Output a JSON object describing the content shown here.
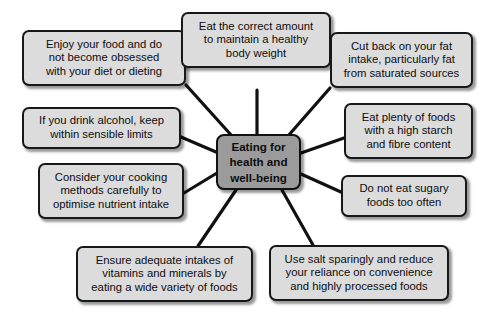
{
  "diagram": {
    "type": "mind-map",
    "title": "Eating for health and well-being",
    "background_color": "#ffffff",
    "node_fill_color": "#dcdcdc",
    "center_fill_color": "#9b9b9b",
    "border_color": "#17181a",
    "connector_color": "#101113",
    "center": {
      "label": "Eating for\nhealth and\nwell-being"
    },
    "nodes": [
      {
        "id": "enjoy-food",
        "label": "Enjoy your food and do\nnot become obsessed\nwith your diet or dieting"
      },
      {
        "id": "correct-amount",
        "label": "Eat the correct amount\nto maintain a healthy\nbody weight"
      },
      {
        "id": "cut-fat",
        "label": "Cut back on your fat\nintake, particularly fat\nfrom saturated sources"
      },
      {
        "id": "alcohol",
        "label": "If you drink alcohol, keep\nwithin sensible limits"
      },
      {
        "id": "starch-fibre",
        "label": "Eat plenty of foods\nwith a high starch\nand fibre content"
      },
      {
        "id": "cooking-methods",
        "label": "Consider your cooking\nmethods carefully to\noptimise nutrient intake"
      },
      {
        "id": "sugary-foods",
        "label": "Do not eat sugary\nfoods too often"
      },
      {
        "id": "vitamins-minerals",
        "label": "Ensure adequate intakes of\nvitamins and minerals by\neating a wide variety of foods"
      },
      {
        "id": "salt-processed",
        "label": "Use salt sparingly and reduce\nyour reliance on convenience\nand highly processed foods"
      }
    ]
  }
}
